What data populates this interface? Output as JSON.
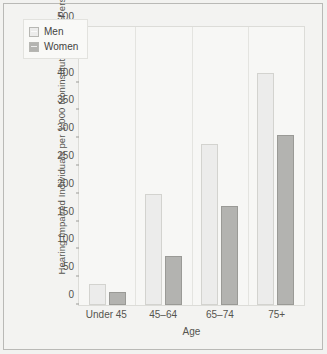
{
  "chart_data": {
    "type": "bar",
    "title": "",
    "subtitle": "",
    "xlabel": "Age",
    "ylabel": "Hearing Impaired Individuals per 1,000 Noninstitutionalized Persons",
    "categories": [
      "Under 45",
      "45–64",
      "65–74",
      "75+"
    ],
    "series": [
      {
        "name": "Men",
        "values": [
          38,
          200,
          290,
          418
        ],
        "color": "#ececeb"
      },
      {
        "name": "Women",
        "values": [
          23,
          88,
          178,
          305
        ],
        "color": "#b3b3b0"
      }
    ],
    "ylim": [
      0,
      500
    ],
    "yticks": [
      0,
      50,
      100,
      150,
      200,
      250,
      300,
      350,
      400,
      450,
      500
    ],
    "ytick_labels": [
      "0",
      "50",
      "100",
      "150",
      "200",
      "250",
      "300",
      "350",
      "400",
      "450",
      "500"
    ],
    "grid": false,
    "legend_position": "top-left",
    "legend_entries": [
      "Men",
      "Women"
    ]
  },
  "legend": {
    "items": [
      {
        "label": "Men",
        "swatch": "men-swatch-icon"
      },
      {
        "label": "Women",
        "swatch": "women-swatch-icon"
      }
    ]
  },
  "axes": {
    "y_title": "Hearing Impaired Individuals per 1,000 Noninstitutionalized Persons",
    "x_title": "Age"
  },
  "colors": {
    "men_bar": "#ececeb",
    "women_bar": "#b3b3b0",
    "plot_background": "#f7f7f5",
    "figure_background": "#f3f3f1",
    "frame_border": "#b9b9b6",
    "text": "#55544f"
  }
}
